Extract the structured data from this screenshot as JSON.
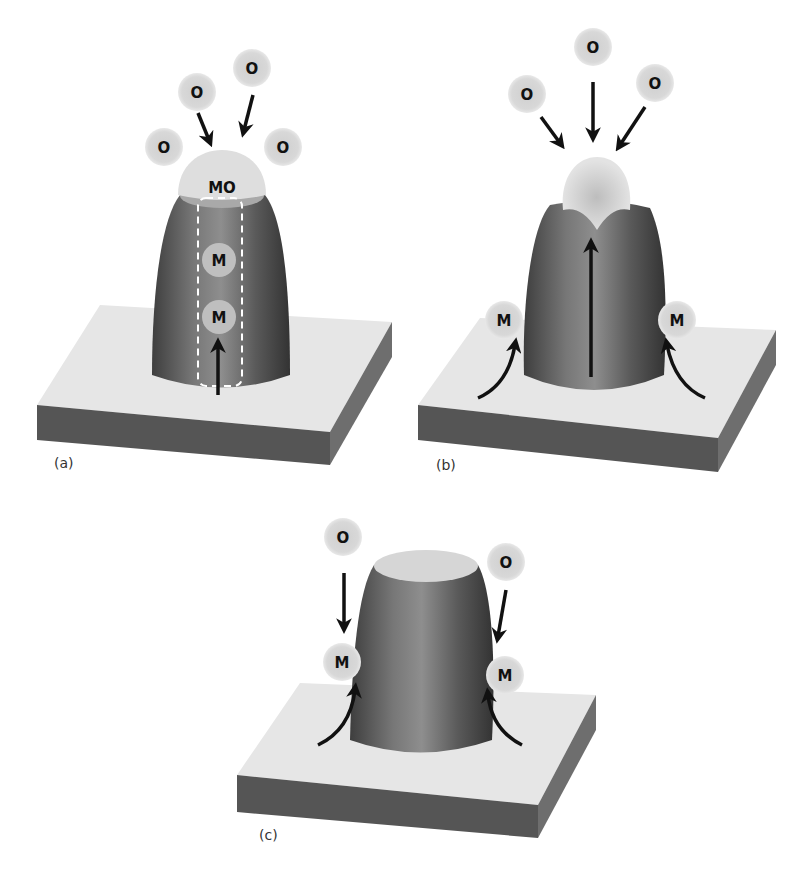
{
  "figure": {
    "panels": [
      {
        "id": "a",
        "label": "(a)",
        "atoms": {
          "oxygen": [
            "O",
            "O",
            "O",
            "O"
          ],
          "oxide_cap": "MO",
          "metal_inside": [
            "M",
            "M"
          ]
        },
        "description": "Metal diffuses up through pillar core (dashed channel) to oxide cap; oxygen arrives from gas phase"
      },
      {
        "id": "b",
        "label": "(b)",
        "atoms": {
          "oxygen": [
            "O",
            "O",
            "O"
          ],
          "metal_surface": [
            "M",
            "M"
          ]
        },
        "description": "Metal diffuses along substrate surface and up the pillar to the oxide tip"
      },
      {
        "id": "c",
        "label": "(c)",
        "atoms": {
          "oxygen": [
            "O",
            "O"
          ],
          "metal_surface": [
            "M",
            "M"
          ]
        },
        "description": "Metal adatoms on sidewalls react with incoming oxygen"
      }
    ],
    "colors": {
      "pillar_dark": "#4a4a4a",
      "pillar_light": "#8a8a8a",
      "slab_top": "#e6e6e6",
      "slab_front": "#555555",
      "slab_side": "#6a6a6a",
      "atom_fill": "#d4d4d4",
      "arrow": "#111111"
    }
  }
}
